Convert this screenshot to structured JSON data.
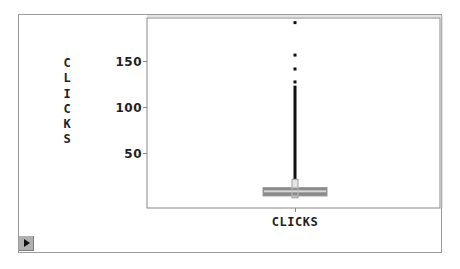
{
  "chart_data": {
    "type": "box",
    "title": "",
    "xlabel": "CLICKS",
    "ylabel": "CLICKS",
    "categories": [
      "CLICKS"
    ],
    "y_ticks": [
      50,
      100,
      150
    ],
    "y_tick_labels": [
      "50",
      "100",
      "150"
    ],
    "ylim": [
      -9,
      196
    ],
    "grid": false,
    "legend": "none",
    "box": {
      "q1": 4,
      "median": 9,
      "q3": 13,
      "whisker_low": 0,
      "whisker_high": 123,
      "notch_low": 2,
      "notch_high": 22
    },
    "outliers": [
      127,
      141,
      156,
      191
    ]
  },
  "ylabel_letters": [
    "C",
    "L",
    "I",
    "C",
    "K",
    "S"
  ],
  "colors": {
    "box_fill": "#8a8a8a",
    "box_stripe": "#d8d8d8",
    "whisker": "#111111",
    "outlier": "#111111",
    "axis": "#888888",
    "text": "#222222"
  },
  "controls": {
    "play_button": "play"
  }
}
